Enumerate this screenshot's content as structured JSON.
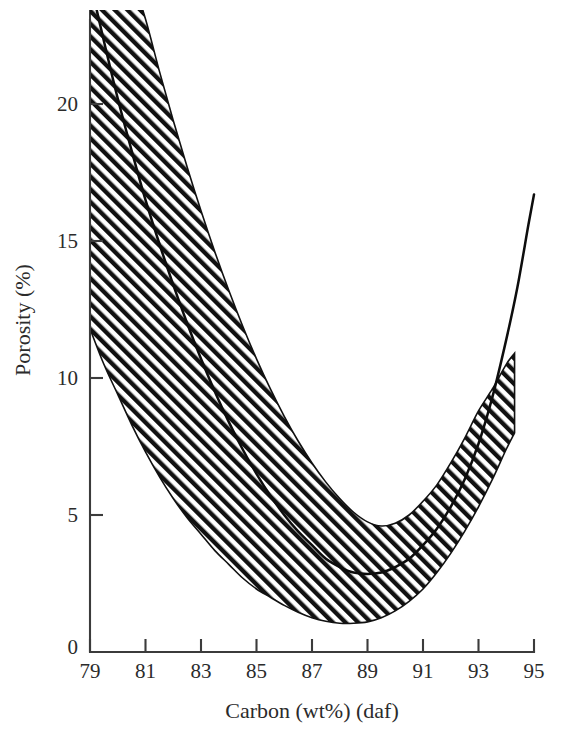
{
  "figure": {
    "background_color": "#ffffff",
    "ink_color": "#1a1a1a"
  },
  "axes": {
    "x_title": "Carbon (wt%) (daf)",
    "y_title": "Porosity (%)",
    "x_ticks": [
      "79",
      "81",
      "83",
      "85",
      "87",
      "89",
      "91",
      "93",
      "95"
    ],
    "y_ticks": [
      "0",
      "5",
      "10",
      "15",
      "20"
    ]
  },
  "chart_data": {
    "type": "line",
    "title": "",
    "subtitle": "",
    "xlabel": "Carbon (wt%) (daf)",
    "ylabel": "Porosity (%)",
    "xlim": [
      79,
      95
    ],
    "ylim": [
      0,
      23
    ],
    "xticks": [
      79,
      81,
      83,
      85,
      87,
      89,
      91,
      93,
      95
    ],
    "yticks": [
      0,
      5,
      10,
      15,
      20
    ],
    "grid": false,
    "legend": false,
    "legend_position": "none",
    "annotations": [],
    "series": [
      {
        "name": "Mean porosity trend",
        "style": "solid-line",
        "color": "#0d0d0d",
        "x": [
          79.0,
          79.5,
          80.0,
          80.5,
          81.0,
          81.5,
          82.0,
          82.5,
          83.0,
          83.5,
          84.0,
          84.5,
          85.0,
          85.5,
          86.0,
          86.5,
          87.0,
          87.5,
          88.0,
          88.5,
          89.0,
          89.5,
          90.0,
          90.5,
          91.0,
          91.5,
          92.0,
          92.5,
          93.0,
          93.5,
          94.0,
          94.4,
          94.8,
          95.0
        ],
        "y": [
          24.5,
          22.3,
          20.2,
          18.3,
          16.5,
          14.9,
          13.4,
          12.0,
          10.7,
          9.5,
          8.4,
          7.4,
          6.5,
          5.7,
          5.0,
          4.4,
          3.9,
          3.4,
          3.1,
          2.9,
          2.85,
          2.9,
          3.1,
          3.4,
          3.9,
          4.5,
          5.3,
          6.3,
          7.6,
          9.3,
          11.4,
          13.3,
          15.6,
          16.7
        ]
      },
      {
        "name": "Upper bound of scatter band",
        "style": "hatched-band-edge",
        "color": "#111111",
        "x": [
          79.0,
          79.5,
          80.0,
          80.5,
          81.0,
          81.5,
          82.0,
          82.5,
          83.0,
          83.5,
          84.0,
          84.5,
          85.0,
          85.5,
          86.0,
          86.5,
          87.0,
          87.5,
          88.0,
          88.5,
          89.0,
          89.5,
          90.0,
          90.5,
          91.0,
          91.5,
          92.0,
          92.5,
          93.0,
          93.5,
          94.0,
          94.3
        ],
        "y": [
          30.0,
          28.2,
          26.4,
          24.7,
          23.1,
          21.2,
          19.4,
          17.7,
          16.1,
          14.6,
          13.2,
          11.9,
          10.7,
          9.6,
          8.6,
          7.7,
          6.9,
          6.2,
          5.6,
          5.1,
          4.75,
          4.6,
          4.7,
          5.0,
          5.5,
          6.1,
          6.9,
          7.8,
          8.8,
          9.6,
          10.5,
          10.9
        ]
      },
      {
        "name": "Lower bound of scatter band",
        "style": "hatched-band-edge",
        "color": "#111111",
        "x": [
          79.0,
          79.5,
          80.0,
          80.5,
          81.0,
          81.5,
          82.0,
          82.5,
          83.0,
          83.5,
          84.0,
          84.5,
          85.0,
          85.5,
          86.0,
          86.5,
          87.0,
          87.5,
          88.0,
          88.5,
          89.0,
          89.5,
          90.0,
          90.5,
          91.0,
          91.5,
          92.0,
          92.5,
          93.0,
          93.5,
          94.0,
          94.3
        ],
        "y": [
          11.8,
          10.5,
          9.4,
          8.3,
          7.3,
          6.4,
          5.6,
          4.9,
          4.3,
          3.7,
          3.2,
          2.7,
          2.3,
          2.0,
          1.7,
          1.45,
          1.25,
          1.12,
          1.05,
          1.05,
          1.1,
          1.25,
          1.5,
          1.85,
          2.3,
          2.9,
          3.6,
          4.4,
          5.3,
          6.3,
          7.4,
          8.0
        ]
      }
    ],
    "band": {
      "name": "Scatter band of measured porosity",
      "fill": "diagonal-hatch-45",
      "hatch_color": "#111111",
      "hatch_background": "#ffffff"
    }
  }
}
